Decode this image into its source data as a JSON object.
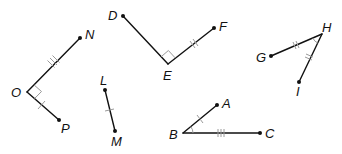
{
  "diagram": {
    "figures": [
      {
        "name": "angle-NOP",
        "points": {
          "N": [
            80,
            38
          ],
          "O": [
            27,
            92
          ],
          "P": [
            59,
            120
          ]
        },
        "right_angle_at": "O",
        "ticks": {
          "ON": 3,
          "OP": 1
        }
      },
      {
        "name": "angle-DEF",
        "points": {
          "D": [
            123,
            16
          ],
          "E": [
            168,
            64
          ],
          "F": [
            214,
            28
          ]
        },
        "right_angle_at": "E",
        "ticks": {
          "EF": 2
        }
      },
      {
        "name": "angle-GHI",
        "points": {
          "G": [
            271,
            56
          ],
          "H": [
            322,
            34
          ],
          "I": [
            299,
            82
          ]
        },
        "angle_arc_at": "H",
        "ticks": {
          "GH": 2,
          "HI": 2
        }
      },
      {
        "name": "segment-LM",
        "points": {
          "L": [
            105,
            90
          ],
          "M": [
            115,
            131
          ]
        },
        "ticks": {
          "LM": 1
        }
      },
      {
        "name": "angle-ABC",
        "points": {
          "A": [
            217,
            105
          ],
          "B": [
            183,
            133
          ],
          "C": [
            260,
            133
          ]
        },
        "angle_arc_at": "B",
        "ticks": {
          "BA": 1,
          "BC": 3
        }
      }
    ],
    "labels": {
      "N": "N",
      "O": "O",
      "P": "P",
      "D": "D",
      "E": "E",
      "F": "F",
      "G": "G",
      "H": "H",
      "I": "I",
      "L": "L",
      "M": "M",
      "A": "A",
      "B": "B",
      "C": "C"
    },
    "colors": {
      "line": "#111111",
      "mark": "#9a9a9a",
      "background": "#ffffff"
    }
  }
}
